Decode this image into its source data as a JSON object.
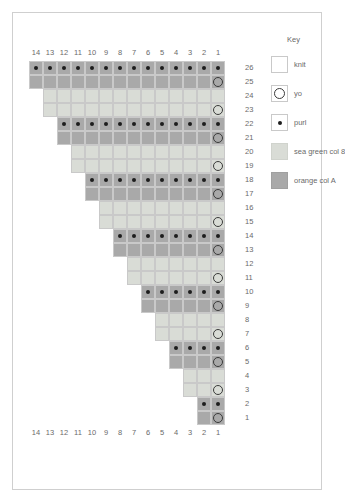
{
  "key": {
    "title": "Key",
    "items": [
      {
        "label": "knit",
        "symbol": "none",
        "swatch": "sw-knit",
        "color": "#ffffff"
      },
      {
        "label": "yo",
        "symbol": "yo",
        "swatch": "sw-yo",
        "color": "#ffffff"
      },
      {
        "label": "purl",
        "symbol": "purl",
        "swatch": "sw-purl",
        "color": "#ffffff"
      },
      {
        "label": "sea green col 8",
        "symbol": "none",
        "swatch": "sw-green",
        "color": "#d9dcd6"
      },
      {
        "label": "orange col A",
        "symbol": "none",
        "swatch": "sw-orange",
        "color": "#a9a9a9"
      }
    ]
  },
  "chart_data": {
    "type": "table",
    "title": "",
    "xlabel": "",
    "ylabel": "",
    "columns_top": [
      "14",
      "13",
      "12",
      "11",
      "10",
      "9",
      "8",
      "7",
      "6",
      "5",
      "4",
      "3",
      "2",
      "1"
    ],
    "columns_bottom": [
      "14",
      "13",
      "12",
      "11",
      "10",
      "9",
      "8",
      "7",
      "6",
      "5",
      "4",
      "3",
      "2",
      "1"
    ],
    "row_labels": [
      "26",
      "25",
      "24",
      "23",
      "22",
      "21",
      "20",
      "19",
      "18",
      "17",
      "16",
      "15",
      "14",
      "13",
      "12",
      "11",
      "10",
      "9",
      "8",
      "7",
      "6",
      "5",
      "4",
      "3",
      "2",
      "1"
    ],
    "legend": [
      "knit",
      "yo",
      "purl",
      "sea green col 8",
      "orange col A"
    ],
    "rows": [
      {
        "num": "26",
        "color": "orange",
        "width": 14,
        "symbols": [
          "purl",
          "purl",
          "purl",
          "purl",
          "purl",
          "purl",
          "purl",
          "purl",
          "purl",
          "purl",
          "purl",
          "purl",
          "purl",
          "purl"
        ]
      },
      {
        "num": "25",
        "color": "orange",
        "width": 14,
        "symbols": [
          "none",
          "none",
          "none",
          "none",
          "none",
          "none",
          "none",
          "none",
          "none",
          "none",
          "none",
          "none",
          "none",
          "yo"
        ]
      },
      {
        "num": "24",
        "color": "green",
        "width": 13,
        "symbols": [
          "none",
          "none",
          "none",
          "none",
          "none",
          "none",
          "none",
          "none",
          "none",
          "none",
          "none",
          "none",
          "none"
        ]
      },
      {
        "num": "23",
        "color": "green",
        "width": 13,
        "symbols": [
          "none",
          "none",
          "none",
          "none",
          "none",
          "none",
          "none",
          "none",
          "none",
          "none",
          "none",
          "none",
          "yo"
        ]
      },
      {
        "num": "22",
        "color": "orange",
        "width": 12,
        "symbols": [
          "purl",
          "purl",
          "purl",
          "purl",
          "purl",
          "purl",
          "purl",
          "purl",
          "purl",
          "purl",
          "purl",
          "purl"
        ]
      },
      {
        "num": "21",
        "color": "orange",
        "width": 12,
        "symbols": [
          "none",
          "none",
          "none",
          "none",
          "none",
          "none",
          "none",
          "none",
          "none",
          "none",
          "none",
          "yo"
        ]
      },
      {
        "num": "20",
        "color": "green",
        "width": 11,
        "symbols": [
          "none",
          "none",
          "none",
          "none",
          "none",
          "none",
          "none",
          "none",
          "none",
          "none",
          "none"
        ]
      },
      {
        "num": "19",
        "color": "green",
        "width": 11,
        "symbols": [
          "none",
          "none",
          "none",
          "none",
          "none",
          "none",
          "none",
          "none",
          "none",
          "none",
          "yo"
        ]
      },
      {
        "num": "18",
        "color": "orange",
        "width": 10,
        "symbols": [
          "purl",
          "purl",
          "purl",
          "purl",
          "purl",
          "purl",
          "purl",
          "purl",
          "purl",
          "purl"
        ]
      },
      {
        "num": "17",
        "color": "orange",
        "width": 10,
        "symbols": [
          "none",
          "none",
          "none",
          "none",
          "none",
          "none",
          "none",
          "none",
          "none",
          "yo"
        ]
      },
      {
        "num": "16",
        "color": "green",
        "width": 9,
        "symbols": [
          "none",
          "none",
          "none",
          "none",
          "none",
          "none",
          "none",
          "none",
          "none"
        ]
      },
      {
        "num": "15",
        "color": "green",
        "width": 9,
        "symbols": [
          "none",
          "none",
          "none",
          "none",
          "none",
          "none",
          "none",
          "none",
          "yo"
        ]
      },
      {
        "num": "14",
        "color": "orange",
        "width": 8,
        "symbols": [
          "purl",
          "purl",
          "purl",
          "purl",
          "purl",
          "purl",
          "purl",
          "purl"
        ]
      },
      {
        "num": "13",
        "color": "orange",
        "width": 8,
        "symbols": [
          "none",
          "none",
          "none",
          "none",
          "none",
          "none",
          "none",
          "yo"
        ]
      },
      {
        "num": "12",
        "color": "green",
        "width": 7,
        "symbols": [
          "none",
          "none",
          "none",
          "none",
          "none",
          "none",
          "none"
        ]
      },
      {
        "num": "11",
        "color": "green",
        "width": 7,
        "symbols": [
          "none",
          "none",
          "none",
          "none",
          "none",
          "none",
          "yo"
        ]
      },
      {
        "num": "10",
        "color": "orange",
        "width": 6,
        "symbols": [
          "purl",
          "purl",
          "purl",
          "purl",
          "purl",
          "purl"
        ]
      },
      {
        "num": "9",
        "color": "orange",
        "width": 6,
        "symbols": [
          "none",
          "none",
          "none",
          "none",
          "none",
          "yo"
        ]
      },
      {
        "num": "8",
        "color": "green",
        "width": 5,
        "symbols": [
          "none",
          "none",
          "none",
          "none",
          "none"
        ]
      },
      {
        "num": "7",
        "color": "green",
        "width": 5,
        "symbols": [
          "none",
          "none",
          "none",
          "none",
          "yo"
        ]
      },
      {
        "num": "6",
        "color": "orange",
        "width": 4,
        "symbols": [
          "purl",
          "purl",
          "purl",
          "purl"
        ]
      },
      {
        "num": "5",
        "color": "orange",
        "width": 4,
        "symbols": [
          "none",
          "none",
          "none",
          "yo"
        ]
      },
      {
        "num": "4",
        "color": "green",
        "width": 3,
        "symbols": [
          "none",
          "none",
          "none"
        ]
      },
      {
        "num": "3",
        "color": "green",
        "width": 3,
        "symbols": [
          "none",
          "none",
          "yo"
        ]
      },
      {
        "num": "2",
        "color": "orange",
        "width": 2,
        "symbols": [
          "purl",
          "purl"
        ]
      },
      {
        "num": "1",
        "color": "orange",
        "width": 2,
        "symbols": [
          "none",
          "yo"
        ]
      }
    ]
  }
}
